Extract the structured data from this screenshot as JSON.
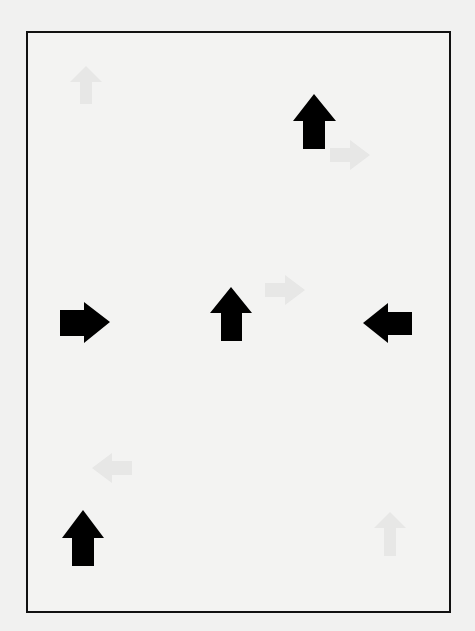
{
  "canvas": {
    "width": 475,
    "height": 631,
    "background_color": "#f1f1f0",
    "frame_color": "#111111"
  },
  "arrows": [
    {
      "id": "arrow-up-top-right",
      "direction": "up",
      "icon": "arrow-up-icon",
      "color": "#000000",
      "cx": 314,
      "cy": 121
    },
    {
      "id": "arrow-right-middle-left",
      "direction": "right",
      "icon": "arrow-right-icon",
      "color": "#000000",
      "cx": 85,
      "cy": 322
    },
    {
      "id": "arrow-up-center",
      "direction": "up",
      "icon": "arrow-up-icon",
      "color": "#000000",
      "cx": 231,
      "cy": 314
    },
    {
      "id": "arrow-left-middle-right",
      "direction": "left",
      "icon": "arrow-left-icon",
      "color": "#000000",
      "cx": 387,
      "cy": 323
    },
    {
      "id": "arrow-up-bottom-left",
      "direction": "up",
      "icon": "arrow-up-icon",
      "color": "#000000",
      "cx": 83,
      "cy": 538
    }
  ],
  "ghost_arrows": [
    {
      "direction": "up",
      "cx": 86,
      "cy": 85
    },
    {
      "direction": "right",
      "cx": 350,
      "cy": 155
    },
    {
      "direction": "right",
      "cx": 285,
      "cy": 290
    },
    {
      "direction": "left",
      "cx": 112,
      "cy": 468
    },
    {
      "direction": "up",
      "cx": 390,
      "cy": 535
    }
  ]
}
